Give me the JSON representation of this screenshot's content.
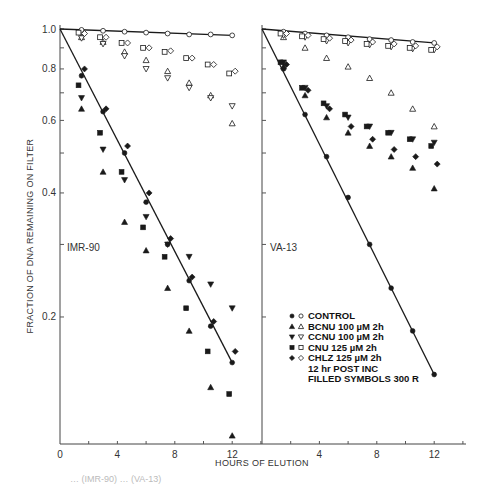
{
  "figure": {
    "ylabel": "FRACTION OF DNA REMAINING ON FILTER",
    "xlabel": "HOURS OF ELUTION",
    "caption_partial": "… (IMR-90) … (VA-13)",
    "y_ticks": [
      "1.0",
      "0.8",
      "0.6",
      "0.4",
      "0.2"
    ],
    "x_ticks_left": [
      "0",
      "4",
      "8",
      "12"
    ],
    "x_ticks_right": [
      "4",
      "8",
      "12"
    ],
    "legend": [
      {
        "filled": "circle",
        "open": "circle",
        "label": "CONTROL"
      },
      {
        "filled": "triangle-up",
        "open": "triangle-up",
        "label": "BCNU 100 µM 2h"
      },
      {
        "filled": "triangle-down",
        "open": "triangle-down",
        "label": "CCNU 100 µM 2h"
      },
      {
        "filled": "square",
        "open": "square",
        "label": "CNU 125 µM 2h"
      },
      {
        "filled": "diamond",
        "open": "diamond",
        "label": "CHLZ 125 µM 2h"
      }
    ],
    "legend_notes": [
      "12 hr POST INC",
      "FILLED SYMBOLS 300 R"
    ]
  },
  "chart_data": [
    {
      "type": "scatter",
      "panel": "IMR-90",
      "title": "IMR-90",
      "xlabel": "HOURS OF ELUTION",
      "ylabel": "FRACTION OF DNA REMAINING ON FILTER",
      "yscale": "log",
      "ylim": [
        0.1,
        1.0
      ],
      "xlim": [
        0,
        14
      ],
      "x": [
        1.5,
        3,
        4.5,
        6,
        7.5,
        9,
        10.5,
        12
      ],
      "series": [
        {
          "name": "CONTROL (open, 0 R)",
          "marker": "circle-open",
          "values": [
            0.995,
            0.99,
            0.985,
            0.98,
            0.975,
            0.97,
            0.97,
            0.965
          ]
        },
        {
          "name": "BCNU 100 µM 2h (open, 0 R)",
          "marker": "triangle-up-open",
          "values": [
            0.955,
            0.93,
            0.88,
            0.84,
            0.79,
            0.74,
            0.69,
            0.59
          ]
        },
        {
          "name": "CCNU 100 µM 2h (open, 0 R)",
          "marker": "triangle-down-open",
          "values": [
            0.95,
            0.92,
            0.86,
            0.8,
            0.76,
            0.72,
            0.68,
            0.65
          ]
        },
        {
          "name": "CNU 125 µM 2h (open, 0 R)",
          "marker": "square-open",
          "values": [
            0.98,
            0.955,
            0.925,
            0.9,
            0.88,
            0.85,
            0.82,
            0.78
          ]
        },
        {
          "name": "CHLZ 125 µM 2h (open, 0 R)",
          "marker": "diamond-open",
          "values": [
            0.975,
            0.955,
            0.925,
            0.9,
            0.885,
            0.85,
            0.82,
            0.79
          ]
        },
        {
          "name": "CONTROL (filled, 300 R)",
          "marker": "circle-filled",
          "values": [
            0.77,
            0.63,
            0.5,
            0.38,
            0.3,
            0.245,
            0.19,
            0.155
          ]
        },
        {
          "name": "BCNU 100 µM 2h (filled, 300 R)",
          "marker": "triangle-up-filled",
          "values": [
            0.64,
            0.45,
            0.34,
            0.29,
            0.235,
            0.185,
            0.135,
            0.103
          ]
        },
        {
          "name": "CCNU 100 µM 2h (filled, 300 R)",
          "marker": "triangle-down-filled",
          "values": [
            0.68,
            0.51,
            0.43,
            0.35,
            0.3,
            0.28,
            0.24,
            0.21
          ]
        },
        {
          "name": "CNU 125 µM 2h (filled, 300 R)",
          "marker": "square-filled",
          "values": [
            0.73,
            0.56,
            0.45,
            0.33,
            0.28,
            0.21,
            0.165,
            0.13
          ]
        },
        {
          "name": "CHLZ 125 µM 2h (filled, 300 R)",
          "marker": "diamond-filled",
          "values": [
            0.8,
            0.64,
            0.52,
            0.4,
            0.31,
            0.25,
            0.195,
            0.165
          ]
        }
      ],
      "fit_lines": [
        {
          "name": "control 0 R",
          "from": [
            0,
            1.0
          ],
          "to": [
            12,
            0.965
          ]
        },
        {
          "name": "control 300 R",
          "from": [
            0,
            1.0
          ],
          "to": [
            12,
            0.155
          ]
        }
      ]
    },
    {
      "type": "scatter",
      "panel": "VA-13",
      "title": "VA-13",
      "xlabel": "HOURS OF ELUTION",
      "ylabel": "FRACTION OF DNA REMAINING ON FILTER",
      "yscale": "log",
      "ylim": [
        0.1,
        1.0
      ],
      "xlim": [
        0,
        14
      ],
      "x": [
        1.5,
        3,
        4.5,
        6,
        7.5,
        9,
        10.5,
        12
      ],
      "series": [
        {
          "name": "CONTROL (open, 0 R)",
          "marker": "circle-open",
          "values": [
            0.985,
            0.975,
            0.965,
            0.955,
            0.945,
            0.94,
            0.93,
            0.925
          ]
        },
        {
          "name": "BCNU 100 µM 2h (open, 0 R)",
          "marker": "triangle-up-open",
          "values": [
            0.955,
            0.9,
            0.85,
            0.81,
            0.76,
            0.7,
            0.64,
            0.58
          ]
        },
        {
          "name": "CCNU 100 µM 2h (open, 0 R)",
          "marker": "triangle-down-open",
          "values": [
            0.965,
            0.955,
            0.935,
            0.925,
            0.915,
            0.905,
            0.895,
            0.89
          ]
        },
        {
          "name": "CNU 125 µM 2h (open, 0 R)",
          "marker": "square-open",
          "values": [
            0.975,
            0.96,
            0.945,
            0.935,
            0.92,
            0.91,
            0.9,
            0.89
          ]
        },
        {
          "name": "CHLZ 125 µM 2h (open, 0 R)",
          "marker": "diamond-open",
          "values": [
            0.975,
            0.965,
            0.95,
            0.94,
            0.93,
            0.92,
            0.91,
            0.905
          ]
        },
        {
          "name": "CONTROL (filled, 300 R)",
          "marker": "circle-filled",
          "values": [
            0.8,
            0.62,
            0.49,
            0.39,
            0.3,
            0.235,
            0.185,
            0.145
          ]
        },
        {
          "name": "BCNU 100 µM 2h (filled, 300 R)",
          "marker": "triangle-up-filled",
          "values": [
            0.81,
            0.69,
            0.61,
            0.56,
            0.52,
            0.49,
            0.46,
            0.41
          ]
        },
        {
          "name": "CCNU 100 µM 2h (filled, 300 R)",
          "marker": "triangle-down-filled",
          "values": [
            0.83,
            0.72,
            0.65,
            0.61,
            0.58,
            0.56,
            0.54,
            0.53
          ]
        },
        {
          "name": "CNU 125 µM 2h (filled, 300 R)",
          "marker": "square-filled",
          "values": [
            0.83,
            0.72,
            0.66,
            0.62,
            0.58,
            0.56,
            0.54,
            0.52
          ]
        },
        {
          "name": "CHLZ 125 µM 2h (filled, 300 R)",
          "marker": "diamond-filled",
          "values": [
            0.82,
            0.71,
            0.64,
            0.58,
            0.54,
            0.51,
            0.49,
            0.47
          ]
        }
      ],
      "fit_lines": [
        {
          "name": "control 0 R",
          "from": [
            0,
            1.0
          ],
          "to": [
            12,
            0.925
          ]
        },
        {
          "name": "control 300 R",
          "from": [
            0,
            1.0
          ],
          "to": [
            12,
            0.145
          ]
        }
      ]
    }
  ]
}
